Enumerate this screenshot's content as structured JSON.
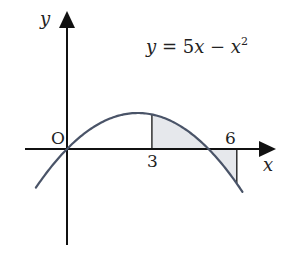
{
  "figure": {
    "equation": {
      "lhs": "y",
      "eq": " = 5",
      "var": "x",
      "minus": " − ",
      "var2": "x",
      "exp": "2"
    },
    "axes": {
      "x_label": "x",
      "y_label": "y",
      "origin_label": "O"
    },
    "ticks": {
      "x3": "3",
      "x6": "6"
    },
    "colors": {
      "axis": "#111111",
      "curve": "#4a5468",
      "shade": "#e6e8ec",
      "text": "#222222"
    }
  },
  "chart_data": {
    "type": "line",
    "function": "5x - x^2",
    "xlabel": "x",
    "ylabel": "y",
    "x_ticks": [
      3,
      6
    ],
    "origin_label": "O",
    "domain_plotted": [
      -1.1,
      6.2
    ],
    "key_points": [
      {
        "x": 0,
        "y": 0,
        "label": "O"
      },
      {
        "x": 2.5,
        "y": 6.25,
        "label": "vertex"
      },
      {
        "x": 3,
        "y": 6
      },
      {
        "x": 5,
        "y": 0
      },
      {
        "x": 6,
        "y": -6
      }
    ],
    "shaded_regions": [
      {
        "from": 3,
        "to": 5,
        "description": "area between curve and x-axis, above axis"
      },
      {
        "from": 5,
        "to": 6,
        "description": "area between curve and x-axis, below axis"
      }
    ],
    "grid": false,
    "legend": null
  }
}
